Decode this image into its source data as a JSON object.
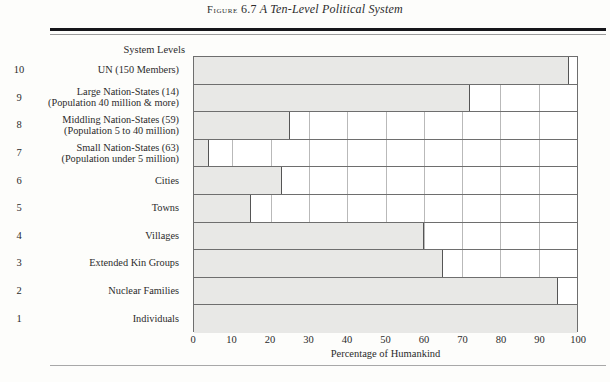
{
  "caption": {
    "figure_word": "Figure",
    "figure_number": "6.7",
    "title": "A Ten-Level Political System"
  },
  "axis": {
    "left_header": "System Levels",
    "xlabel": "Percentage of Humankind",
    "xticks": [
      "0",
      "10",
      "20",
      "30",
      "40",
      "50",
      "60",
      "70",
      "80",
      "90",
      "100"
    ]
  },
  "colors": {
    "bar_fill": "#e8e8e6",
    "bar_stroke": "#555555",
    "grid": "#b9b9b9",
    "frame": "#6e6e6e",
    "rule_thick": "#16161a"
  },
  "chart_data": {
    "type": "bar",
    "orientation": "horizontal",
    "title": "A Ten-Level Political System",
    "xlabel": "Percentage of Humankind",
    "ylabel": "System Levels",
    "xlim": [
      0,
      100
    ],
    "grid": true,
    "legend": "none",
    "categories": [
      "UN (150 Members)",
      "Large Nation-States (14)",
      "Middling Nation-States (59)",
      "Small Nation-States (63)",
      "Cities",
      "Towns",
      "Villages",
      "Extended Kin Groups",
      "Nuclear Families",
      "Individuals"
    ],
    "values": [
      98,
      72,
      25,
      4,
      23,
      15,
      60,
      65,
      95,
      100
    ],
    "rows": [
      {
        "level": "10",
        "label": "UN (150 Members)",
        "sublabel": "",
        "value": 98
      },
      {
        "level": "9",
        "label": "Large Nation-States (14)",
        "sublabel": "(Population 40 million & more)",
        "value": 72
      },
      {
        "level": "8",
        "label": "Middling Nation-States (59)",
        "sublabel": "(Population 5 to 40 million)",
        "value": 25
      },
      {
        "level": "7",
        "label": "Small Nation-States (63)",
        "sublabel": "(Population under 5 million)",
        "value": 4
      },
      {
        "level": "6",
        "label": "Cities",
        "sublabel": "",
        "value": 23
      },
      {
        "level": "5",
        "label": "Towns",
        "sublabel": "",
        "value": 15
      },
      {
        "level": "4",
        "label": "Villages",
        "sublabel": "",
        "value": 60
      },
      {
        "level": "3",
        "label": "Extended Kin Groups",
        "sublabel": "",
        "value": 65
      },
      {
        "level": "2",
        "label": "Nuclear Families",
        "sublabel": "",
        "value": 95
      },
      {
        "level": "1",
        "label": "Individuals",
        "sublabel": "",
        "value": 100
      }
    ]
  }
}
